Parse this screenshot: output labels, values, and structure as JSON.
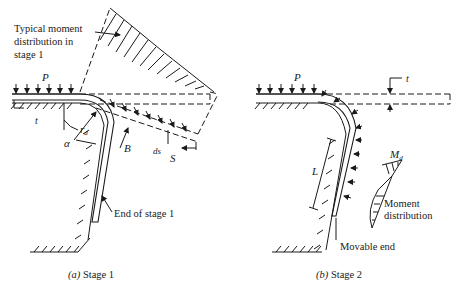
{
  "panel_a": {
    "caption_letter": "(a)",
    "caption_text": " Stage 1",
    "annotation_moment_line1": "Typical moment",
    "annotation_moment_line2": "distribution in",
    "annotation_moment_line3": "stage 1",
    "label_P": "P",
    "label_t": "t",
    "label_alpha": "α",
    "label_rd": "r",
    "label_rd_sub": "d",
    "label_B": "B",
    "label_ds": "ds",
    "label_S": "S",
    "annotation_end": "End of stage 1"
  },
  "panel_b": {
    "caption_letter": "(b)",
    "caption_text": " Stage 2",
    "label_P": "P",
    "label_t": "t",
    "label_L": "L",
    "label_Md": "M",
    "label_Md_sub": "d",
    "annotation_moment_line1": "Moment",
    "annotation_moment_line2": "distribution",
    "annotation_movable": "Movable end"
  }
}
